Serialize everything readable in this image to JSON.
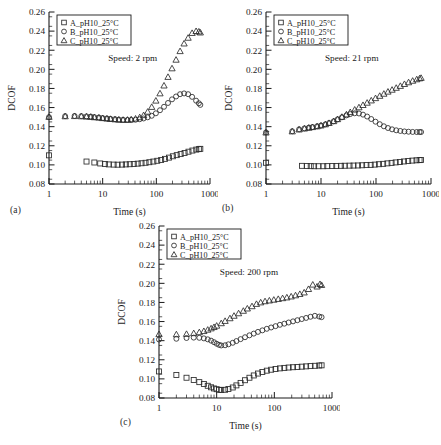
{
  "figure": {
    "panels": [
      {
        "id": "a",
        "label": "(a)",
        "annotation": "Speed: 2 rpm",
        "legend": [
          "A_pH10_25°C",
          "B_pH10_25°C",
          "C_pH10_25°C"
        ]
      },
      {
        "id": "b",
        "label": "(b)",
        "annotation": "Speed: 21 rpm",
        "legend": [
          "A_pH10_25°C",
          "B_pH10_25°C",
          "C_pH10_25°C"
        ]
      },
      {
        "id": "c",
        "label": "(c)",
        "annotation": "Speed: 200 rpm",
        "legend": [
          "A_pH10_25°C",
          "B_pH10_25°C",
          "C_pH10_25°C"
        ]
      }
    ]
  },
  "axes": {
    "ylabel": "DCOF",
    "xlabel": "Time (s)",
    "ylim": [
      0.08,
      0.26
    ],
    "ytick_labels": [
      "0.08",
      "0.10",
      "0.12",
      "0.14",
      "0.16",
      "0.18",
      "0.20",
      "0.22",
      "0.24",
      "0.26"
    ],
    "ytick_values": [
      0.08,
      0.1,
      0.12,
      0.14,
      0.16,
      0.18,
      0.2,
      0.22,
      0.24,
      0.26
    ],
    "xlim": [
      1,
      1000
    ],
    "xscale": "log",
    "xtick_labels": [
      "1",
      "10",
      "100",
      "1000"
    ],
    "xtick_values": [
      1,
      10,
      100,
      1000
    ],
    "grid": false
  },
  "markers": {
    "A_pH10_25°C": "square",
    "B_pH10_25°C": "circle",
    "C_pH10_25°C": "triangle"
  },
  "colors": {
    "axis": "#1a1a1a",
    "marker_stroke": "#2b2b2b",
    "background": "#ffffff"
  },
  "chart_data": [
    {
      "type": "scatter",
      "panel": "a",
      "title": "Speed: 2 rpm",
      "xlabel": "Time (s)",
      "ylabel": "DCOF",
      "xscale": "log",
      "xlim": [
        1,
        1000
      ],
      "ylim": [
        0.08,
        0.26
      ],
      "legend_position": "upper-left",
      "series": [
        {
          "name": "A_pH10_25°C",
          "marker": "square",
          "x": [
            1,
            5,
            7,
            9,
            11,
            13,
            16,
            19,
            23,
            27,
            32,
            38,
            45,
            53,
            63,
            74,
            88,
            104,
            123,
            145,
            172,
            203,
            240,
            284,
            336,
            397,
            470,
            555,
            620,
            660
          ],
          "y": [
            0.11,
            0.1035,
            0.1025,
            0.1015,
            0.101,
            0.1005,
            0.1003,
            0.1002,
            0.1003,
            0.1005,
            0.1007,
            0.101,
            0.1013,
            0.1017,
            0.1022,
            0.1028,
            0.1035,
            0.1043,
            0.1052,
            0.1063,
            0.1076,
            0.109,
            0.1102,
            0.1113,
            0.1125,
            0.1138,
            0.115,
            0.116,
            0.1165,
            0.1168
          ]
        },
        {
          "name": "B_pH10_25°C",
          "marker": "circle",
          "x": [
            1,
            2,
            3,
            4,
            5,
            6,
            7,
            8.5,
            10,
            12,
            14,
            17,
            20,
            24,
            29,
            34,
            41,
            49,
            58,
            69,
            82,
            98,
            117,
            139,
            165,
            196,
            233,
            277,
            329,
            391,
            464,
            551,
            620,
            660
          ],
          "y": [
            0.15,
            0.151,
            0.1512,
            0.151,
            0.1508,
            0.1505,
            0.15,
            0.1496,
            0.149,
            0.1486,
            0.1482,
            0.1478,
            0.1474,
            0.1472,
            0.147,
            0.147,
            0.1473,
            0.1478,
            0.1486,
            0.1498,
            0.1514,
            0.154,
            0.1572,
            0.1608,
            0.1648,
            0.1686,
            0.1716,
            0.174,
            0.1748,
            0.174,
            0.1712,
            0.1672,
            0.1645,
            0.1628
          ]
        },
        {
          "name": "C_pH10_25°C",
          "marker": "triangle",
          "x": [
            1,
            2,
            3,
            4,
            5,
            6,
            7,
            8.5,
            10,
            12,
            14,
            17,
            20,
            24,
            29,
            34,
            41,
            49,
            58,
            69,
            82,
            98,
            117,
            139,
            165,
            196,
            233,
            277,
            329,
            391,
            464,
            551,
            620,
            660
          ],
          "y": [
            0.1502,
            0.1508,
            0.151,
            0.1508,
            0.1505,
            0.1502,
            0.1498,
            0.1494,
            0.1489,
            0.1484,
            0.148,
            0.1476,
            0.1473,
            0.1471,
            0.1472,
            0.1476,
            0.1484,
            0.1498,
            0.152,
            0.1556,
            0.1606,
            0.1672,
            0.1748,
            0.183,
            0.192,
            0.201,
            0.21,
            0.219,
            0.227,
            0.233,
            0.238,
            0.24,
            0.2395,
            0.2385
          ]
        }
      ]
    },
    {
      "type": "scatter",
      "panel": "b",
      "title": "Speed: 21 rpm",
      "xlabel": "Time (s)",
      "ylabel": "DCOF",
      "xscale": "log",
      "xlim": [
        1,
        1000
      ],
      "ylim": [
        0.08,
        0.26
      ],
      "legend_position": "upper-left",
      "series": [
        {
          "name": "A_pH10_25°C",
          "marker": "square",
          "x": [
            1,
            4.5,
            5.5,
            6.5,
            7.5,
            9,
            11,
            13,
            16,
            19,
            23,
            27,
            33,
            39,
            47,
            56,
            67,
            80,
            95,
            113,
            135,
            161,
            192,
            228,
            272,
            323,
            385,
            458,
            545,
            620,
            660
          ],
          "y": [
            0.1022,
            0.099,
            0.0988,
            0.0987,
            0.0986,
            0.0986,
            0.0986,
            0.0987,
            0.0988,
            0.0989,
            0.099,
            0.0991,
            0.0992,
            0.0993,
            0.0994,
            0.0996,
            0.0998,
            0.1,
            0.1003,
            0.1007,
            0.1011,
            0.1016,
            0.1021,
            0.1026,
            0.1031,
            0.1036,
            0.1041,
            0.1045,
            0.1048,
            0.105,
            0.1051
          ]
        },
        {
          "name": "B_pH10_25°C",
          "marker": "circle",
          "x": [
            1,
            3,
            4,
            5,
            6,
            7,
            8.5,
            10,
            12,
            14,
            17,
            20,
            24,
            29,
            34,
            41,
            49,
            58,
            69,
            82,
            98,
            117,
            139,
            165,
            196,
            233,
            277,
            329,
            391,
            464,
            551,
            620,
            660
          ],
          "y": [
            0.134,
            0.1352,
            0.1372,
            0.1382,
            0.139,
            0.1396,
            0.1404,
            0.1412,
            0.1424,
            0.1438,
            0.1456,
            0.1476,
            0.1498,
            0.1518,
            0.1532,
            0.154,
            0.1538,
            0.1526,
            0.1506,
            0.148,
            0.1452,
            0.1426,
            0.1404,
            0.1386,
            0.1372,
            0.1362,
            0.1355,
            0.135,
            0.1347,
            0.1345,
            0.1344,
            0.1344,
            0.1344
          ]
        },
        {
          "name": "C_pH10_25°C",
          "marker": "triangle",
          "x": [
            1,
            3,
            4,
            5,
            6,
            7,
            8.5,
            10,
            12,
            14,
            17,
            20,
            24,
            29,
            34,
            41,
            49,
            58,
            69,
            82,
            98,
            117,
            139,
            165,
            196,
            233,
            277,
            329,
            391,
            464,
            551,
            620,
            660
          ],
          "y": [
            0.1338,
            0.135,
            0.137,
            0.138,
            0.1388,
            0.1395,
            0.1403,
            0.1412,
            0.1424,
            0.1438,
            0.1457,
            0.1478,
            0.1502,
            0.1528,
            0.1552,
            0.1578,
            0.1602,
            0.1626,
            0.165,
            0.1674,
            0.1698,
            0.1722,
            0.1744,
            0.1766,
            0.1786,
            0.1806,
            0.1826,
            0.1846,
            0.1864,
            0.188,
            0.1895,
            0.1905,
            0.191
          ]
        }
      ]
    },
    {
      "type": "scatter",
      "panel": "c",
      "title": "Speed: 200 rpm",
      "xlabel": "Time (s)",
      "ylabel": "DCOF",
      "xscale": "log",
      "xlim": [
        1,
        1000
      ],
      "ylim": [
        0.08,
        0.26
      ],
      "legend_position": "upper-left",
      "series": [
        {
          "name": "A_pH10_25°C",
          "marker": "square",
          "x": [
            1,
            2,
            3,
            4,
            5,
            6,
            7,
            8,
            9,
            10,
            11,
            12,
            14,
            16,
            19,
            22,
            26,
            31,
            37,
            44,
            52,
            62,
            74,
            88,
            105,
            125,
            149,
            177,
            211,
            251,
            299,
            356,
            424,
            505,
            601,
            660
          ],
          "y": [
            0.1078,
            0.104,
            0.1012,
            0.0988,
            0.0966,
            0.0946,
            0.0928,
            0.0912,
            0.09,
            0.0892,
            0.0886,
            0.0884,
            0.0886,
            0.0894,
            0.091,
            0.0932,
            0.0958,
            0.0986,
            0.1012,
            0.1036,
            0.1056,
            0.1072,
            0.1086,
            0.1096,
            0.1104,
            0.111,
            0.1115,
            0.1119,
            0.1122,
            0.1125,
            0.1128,
            0.1131,
            0.1134,
            0.1137,
            0.114,
            0.1142
          ]
        },
        {
          "name": "B_pH10_25°C",
          "marker": "circle",
          "x": [
            1,
            2,
            3,
            4,
            5,
            6,
            7,
            8,
            9,
            10,
            11,
            12,
            14,
            16,
            19,
            22,
            26,
            31,
            37,
            44,
            52,
            62,
            74,
            88,
            105,
            125,
            149,
            177,
            211,
            251,
            299,
            356,
            424,
            505,
            601,
            660
          ],
          "y": [
            0.1412,
            0.142,
            0.1428,
            0.1432,
            0.143,
            0.1424,
            0.1414,
            0.14,
            0.1384,
            0.1368,
            0.1356,
            0.135,
            0.1352,
            0.1362,
            0.1378,
            0.1396,
            0.1416,
            0.1436,
            0.1456,
            0.1474,
            0.1492,
            0.1508,
            0.1524,
            0.1538,
            0.1552,
            0.1566,
            0.1578,
            0.159,
            0.1602,
            0.1614,
            0.1626,
            0.1638,
            0.165,
            0.166,
            0.1652,
            0.1646
          ]
        },
        {
          "name": "C_pH10_25°C",
          "marker": "triangle",
          "x": [
            1,
            2,
            3,
            4,
            5,
            6,
            7,
            8,
            9,
            10,
            12,
            14,
            17,
            20,
            24,
            29,
            34,
            41,
            49,
            58,
            69,
            82,
            98,
            117,
            139,
            165,
            196,
            233,
            277,
            329,
            391,
            464,
            551,
            620,
            660
          ],
          "y": [
            0.1468,
            0.1466,
            0.147,
            0.1478,
            0.1488,
            0.15,
            0.1514,
            0.1528,
            0.1542,
            0.1556,
            0.1582,
            0.1606,
            0.1634,
            0.166,
            0.1686,
            0.1712,
            0.1736,
            0.176,
            0.1784,
            0.18,
            0.1812,
            0.182,
            0.1828,
            0.1836,
            0.1844,
            0.1852,
            0.1862,
            0.1874,
            0.1888,
            0.1904,
            0.194,
            0.1986,
            0.1966,
            0.1992,
            0.1982
          ]
        }
      ]
    }
  ]
}
